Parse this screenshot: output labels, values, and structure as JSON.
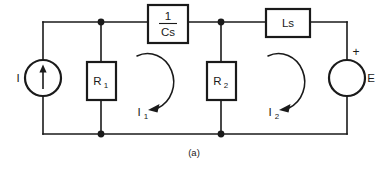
{
  "figure": {
    "caption": "(a)",
    "type": "electrical-circuit-schematic",
    "line_color": "#1a1a1a",
    "background_color": "#ffffff"
  },
  "components": {
    "current_source": {
      "label": "I",
      "symbol": "circle-with-up-arrow",
      "position": "left-branch"
    },
    "resistor_1": {
      "label_main": "R",
      "label_sub": "1",
      "symbol": "rectangle-box",
      "position": "first-shunt-branch"
    },
    "resistor_2": {
      "label_main": "R",
      "label_sub": "2",
      "symbol": "rectangle-box",
      "position": "second-shunt-branch"
    },
    "capacitor": {
      "numerator": "1",
      "denominator": "Cs",
      "symbol": "rectangle-box-fraction",
      "position": "top-series-left"
    },
    "inductor": {
      "label": "Ls",
      "symbol": "rectangle-box",
      "position": "top-series-right"
    },
    "voltage_source": {
      "label": "E",
      "polarity_marker": "+",
      "symbol": "circle",
      "position": "right-branch"
    }
  },
  "mesh_currents": [
    {
      "label_main": "I",
      "label_sub": "1",
      "direction": "clockwise",
      "loop": "left-mesh"
    },
    {
      "label_main": "I",
      "label_sub": "2",
      "direction": "clockwise",
      "loop": "right-mesh"
    }
  ]
}
